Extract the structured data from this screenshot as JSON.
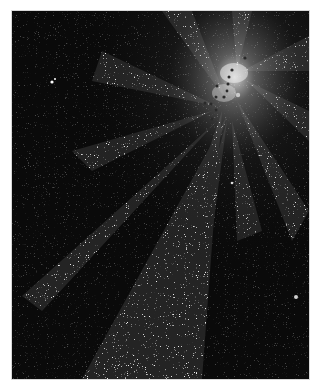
{
  "image": {
    "description": "Artwork of a radiating white starburst of speckled rays on a black background, with a cluster of small dark dots at the bright center",
    "colors": {
      "background": "#0a0a0a",
      "border": "#ffffff",
      "rays": "#e8e8e8",
      "center_glow": "#f5f5f5",
      "dots": "#2a2a2a"
    },
    "center": {
      "x": 235,
      "y": 60
    },
    "dark_dots": [
      [
        245,
        58
      ],
      [
        232,
        70
      ],
      [
        229,
        78
      ],
      [
        229,
        86
      ],
      [
        224,
        98
      ],
      [
        218,
        86
      ],
      [
        216,
        96
      ],
      [
        210,
        103
      ],
      [
        217,
        108
      ],
      [
        205,
        120
      ],
      [
        212,
        131
      ],
      [
        230,
        74
      ],
      [
        222,
        96
      ]
    ]
  }
}
